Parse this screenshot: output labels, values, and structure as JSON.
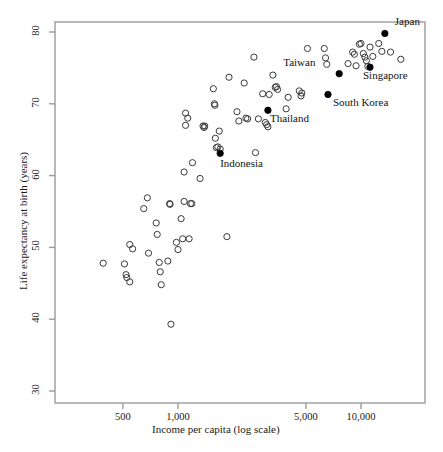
{
  "figure": {
    "background": "#ffffff",
    "frame_color": "#9a9a9a",
    "marker_open_stroke": "#3a3a3a",
    "marker_filled_fill": "#000000"
  },
  "chart_data": {
    "type": "scatter",
    "title": "",
    "xlabel": "Income per capita (log scale)",
    "ylabel": "Life expectancy at birth (years)",
    "xscale": "log",
    "yscale": "linear",
    "xlim": [
      300,
      26000
    ],
    "ylim": [
      28,
      81.5
    ],
    "xticks": [
      500,
      1000,
      5000,
      10000
    ],
    "xticklabels": [
      "500",
      "1,000",
      "5,000",
      "10,000"
    ],
    "yticks": [
      30,
      40,
      50,
      60,
      70,
      80
    ],
    "yticklabels": [
      "30",
      "40",
      "50",
      "60",
      "70",
      "80"
    ],
    "grid": false,
    "legend": "none",
    "series": [
      {
        "name": "Other economies",
        "marker": "open-circle",
        "points": [
          {
            "x": 390,
            "y": 47.8
          },
          {
            "x": 510,
            "y": 47.7
          },
          {
            "x": 520,
            "y": 46.2
          },
          {
            "x": 525,
            "y": 45.8
          },
          {
            "x": 545,
            "y": 45.2
          },
          {
            "x": 545,
            "y": 50.4
          },
          {
            "x": 565,
            "y": 49.8
          },
          {
            "x": 650,
            "y": 55.4
          },
          {
            "x": 680,
            "y": 56.9
          },
          {
            "x": 690,
            "y": 49.2
          },
          {
            "x": 760,
            "y": 53.4
          },
          {
            "x": 770,
            "y": 51.8
          },
          {
            "x": 790,
            "y": 47.9
          },
          {
            "x": 800,
            "y": 46.6
          },
          {
            "x": 810,
            "y": 44.8
          },
          {
            "x": 880,
            "y": 48.1
          },
          {
            "x": 900,
            "y": 56.1
          },
          {
            "x": 905,
            "y": 56.0
          },
          {
            "x": 915,
            "y": 39.3
          },
          {
            "x": 980,
            "y": 50.7
          },
          {
            "x": 1000,
            "y": 49.7
          },
          {
            "x": 1040,
            "y": 54.0
          },
          {
            "x": 1060,
            "y": 51.2
          },
          {
            "x": 1080,
            "y": 56.4
          },
          {
            "x": 1080,
            "y": 60.5
          },
          {
            "x": 1100,
            "y": 68.7
          },
          {
            "x": 1100,
            "y": 67.0
          },
          {
            "x": 1130,
            "y": 68.0
          },
          {
            "x": 1150,
            "y": 51.2
          },
          {
            "x": 1170,
            "y": 56.1
          },
          {
            "x": 1190,
            "y": 56.1
          },
          {
            "x": 1200,
            "y": 61.8
          },
          {
            "x": 1320,
            "y": 59.6
          },
          {
            "x": 1370,
            "y": 66.9
          },
          {
            "x": 1390,
            "y": 66.7
          },
          {
            "x": 1400,
            "y": 66.9
          },
          {
            "x": 1560,
            "y": 72.1
          },
          {
            "x": 1580,
            "y": 70.0
          },
          {
            "x": 1590,
            "y": 69.8
          },
          {
            "x": 1600,
            "y": 65.2
          },
          {
            "x": 1620,
            "y": 63.9
          },
          {
            "x": 1650,
            "y": 64.0
          },
          {
            "x": 1680,
            "y": 66.2
          },
          {
            "x": 1700,
            "y": 63.7
          },
          {
            "x": 1850,
            "y": 51.5
          },
          {
            "x": 1900,
            "y": 73.7
          },
          {
            "x": 2100,
            "y": 68.9
          },
          {
            "x": 2150,
            "y": 67.6
          },
          {
            "x": 2300,
            "y": 72.9
          },
          {
            "x": 2350,
            "y": 68.0
          },
          {
            "x": 2400,
            "y": 67.9
          },
          {
            "x": 2600,
            "y": 76.5
          },
          {
            "x": 2650,
            "y": 63.2
          },
          {
            "x": 2750,
            "y": 67.9
          },
          {
            "x": 2900,
            "y": 71.4
          },
          {
            "x": 3000,
            "y": 67.4
          },
          {
            "x": 3050,
            "y": 67.1
          },
          {
            "x": 3100,
            "y": 66.8
          },
          {
            "x": 3150,
            "y": 71.3
          },
          {
            "x": 3300,
            "y": 74.0
          },
          {
            "x": 3400,
            "y": 72.3
          },
          {
            "x": 3450,
            "y": 72.4
          },
          {
            "x": 3500,
            "y": 72.0
          },
          {
            "x": 3900,
            "y": 69.3
          },
          {
            "x": 4000,
            "y": 70.9
          },
          {
            "x": 4600,
            "y": 71.8
          },
          {
            "x": 4700,
            "y": 71.1
          },
          {
            "x": 4750,
            "y": 71.5
          },
          {
            "x": 5100,
            "y": 77.7
          },
          {
            "x": 6300,
            "y": 77.7
          },
          {
            "x": 6400,
            "y": 76.4
          },
          {
            "x": 6500,
            "y": 75.5
          },
          {
            "x": 8500,
            "y": 75.6
          },
          {
            "x": 9000,
            "y": 77.2
          },
          {
            "x": 9200,
            "y": 76.9
          },
          {
            "x": 9400,
            "y": 75.3
          },
          {
            "x": 9800,
            "y": 78.3
          },
          {
            "x": 10000,
            "y": 78.4
          },
          {
            "x": 10300,
            "y": 77.0
          },
          {
            "x": 10500,
            "y": 76.5
          },
          {
            "x": 10700,
            "y": 76.0
          },
          {
            "x": 10900,
            "y": 75.2
          },
          {
            "x": 11200,
            "y": 77.9
          },
          {
            "x": 11600,
            "y": 76.6
          },
          {
            "x": 12500,
            "y": 78.4
          },
          {
            "x": 13000,
            "y": 77.3
          },
          {
            "x": 14500,
            "y": 77.2
          },
          {
            "x": 16500,
            "y": 76.2
          }
        ]
      },
      {
        "name": "Labeled East Asian economies",
        "marker": "filled-circle",
        "points": [
          {
            "x": 13500,
            "y": 79.8,
            "label": "Japan",
            "label_dx": 10,
            "label_dy": -11
          },
          {
            "x": 11200,
            "y": 75.1,
            "label": "Singapore",
            "label_dx": -7,
            "label_dy": 9
          },
          {
            "x": 7600,
            "y": 74.2,
            "label": "Taiwan",
            "label_dx": -56,
            "label_dy": -11
          },
          {
            "x": 6600,
            "y": 71.3,
            "label": "South Korea",
            "label_dx": 5,
            "label_dy": 9
          },
          {
            "x": 3100,
            "y": 69.1,
            "label": "Thailand",
            "label_dx": 2,
            "label_dy": 9
          },
          {
            "x": 1700,
            "y": 63.1,
            "label": "Indonesia",
            "label_dx": 0,
            "label_dy": 11
          }
        ]
      }
    ]
  }
}
